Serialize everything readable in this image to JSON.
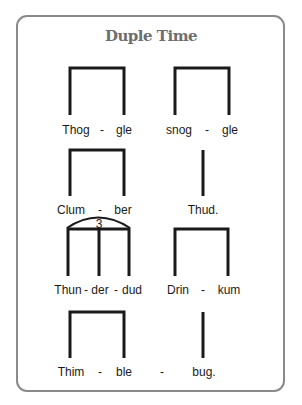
{
  "title": "Duple Time",
  "rhythm_rows": [
    {
      "left": {
        "type": "beamed-pair",
        "syllables": [
          "Thog",
          "-",
          "gle"
        ]
      },
      "right": {
        "type": "beamed-pair",
        "syllables": [
          "snog",
          "-",
          "gle"
        ]
      }
    },
    {
      "left": {
        "type": "beamed-pair",
        "syllables": [
          "Clum",
          "-",
          "ber"
        ]
      },
      "right": {
        "type": "single-stem",
        "syllables": [
          "Thud."
        ]
      }
    },
    {
      "left": {
        "type": "triplet",
        "tuplet_number": "3",
        "syllables": [
          "Thun",
          "-",
          "der",
          "-",
          "dud"
        ]
      },
      "right": {
        "type": "beamed-pair",
        "syllables": [
          "Drin",
          "-",
          "kum"
        ]
      }
    },
    {
      "left": {
        "type": "beamed-pair",
        "syllables": [
          "Thim",
          "-",
          "ble"
        ]
      },
      "right": {
        "type": "single-stem",
        "syllables": [
          "-",
          "bug."
        ]
      }
    }
  ],
  "colors": {
    "stroke": "#1a1a1a",
    "border": "#8a8a8a",
    "title": "#6e6e6e"
  }
}
